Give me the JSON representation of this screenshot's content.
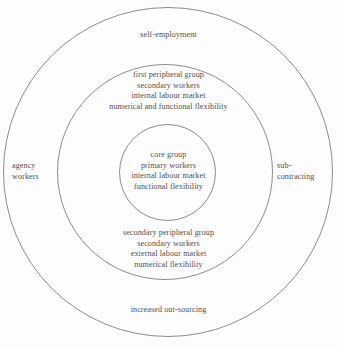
{
  "diagram": {
    "type": "concentric-circles",
    "stroke_color": "#8c8c8c",
    "text_color": "#4f4f4f",
    "background_color": "#fdfdfd",
    "rings": [
      {
        "name": "outer-ring",
        "center": [
          168,
          172
        ],
        "diameter": 330
      },
      {
        "name": "middle-ring",
        "center": [
          165,
          172
        ],
        "diameter": 216
      },
      {
        "name": "inner-ring",
        "center": [
          167,
          172
        ],
        "diameter": 97
      }
    ],
    "labels": {
      "self_employment": "self-employment",
      "first_peripheral_group": "first peripheral group\nsecondary workers\ninternal labour market\nnumerical and functional flexibility",
      "core_group": "core group\nprimary workers\ninternal labour market\nfunctional flexibility",
      "secondary_peripheral_group": "secondary peripheral group\nsecondary workers\nexternal labour market\nnumerical flexibility",
      "increased_outsourcing": "increased out-sourcing",
      "agency_workers": "agency\nworkers",
      "sub_contracting": "sub-\ncontracting"
    }
  }
}
